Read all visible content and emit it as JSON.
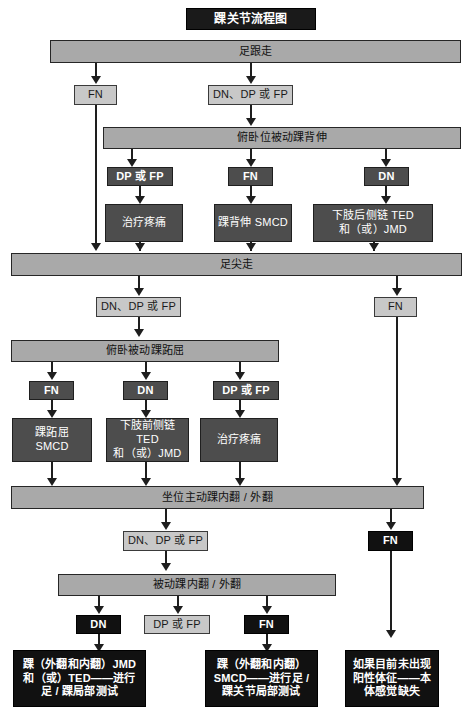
{
  "document": {
    "title": "踝关节流程图",
    "language": "zh-CN"
  },
  "nodes": {
    "title": "踝关节流程图",
    "heel_walk": "足跟走",
    "fn_heel": "FN",
    "dn_dp_fp_heel": "DN、DP 或 FP",
    "prone_passive_dorsiflexion": "俯卧位被动踝背伸",
    "dp_or_fp_1": "DP 或 FP",
    "fn_1": "FN",
    "dn_1": "DN",
    "treat_pain_1": "治疗疼痛",
    "dorsiflexion_smcd": "踝背伸 SMCD",
    "posterior_chain": "下肢后侧链 TED\n和（或）JMD",
    "toe_walk": "足尖走",
    "dn_dp_fp_toe": "DN、DP 或 FP",
    "fn_toe_right": "FN",
    "prone_passive_plantarflexion": "俯卧被动踝跖屈",
    "fn_2": "FN",
    "dn_2": "DN",
    "dp_or_fp_2": "DP 或 FP",
    "plantarflexion_smcd": "踝跖屈\nSMCD",
    "anterior_chain": "下肢前侧链 TED\n和（或）JMD",
    "treat_pain_2": "治疗疼痛",
    "seated_active_inv_ev": "坐位主动踝内翻 / 外翻",
    "dn_dp_fp_seated": "DN、DP 或 FP",
    "fn_seated_right": "FN",
    "passive_inv_ev": "被动踝内翻 / 外翻",
    "dn_3": "DN",
    "dp_or_fp_3": "DP 或 FP",
    "fn_3": "FN",
    "outcome_jmd_ted": "踝（外翻和内翻）JMD\n和（或）TED——进行\n足 / 踝局部测试",
    "outcome_smcd": "踝（外翻和内翻）\nSMCD——进行足 /\n踝关节局部测试",
    "outcome_proprioception": "如果目前未出现\n阳性体征——本\n体感觉缺失"
  },
  "colors": {
    "banner_fill": "#a9a9a9",
    "light_chip_fill": "#c8c8c8",
    "mid_box_fill": "#4d4d4d",
    "dark_box_fill": "#111111",
    "line": "#1e1e1e",
    "page_background": "#ffffff",
    "light_text": "#1a1a1a",
    "dark_text": "#ffffff"
  }
}
